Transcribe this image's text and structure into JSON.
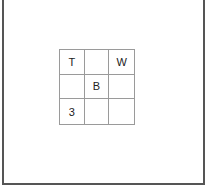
{
  "grid": {
    "rows": 3,
    "cols": 3,
    "cells": [
      [
        "T",
        "",
        "W"
      ],
      [
        "",
        "B",
        ""
      ],
      [
        "3",
        "",
        ""
      ]
    ]
  },
  "colors": {
    "frame": "#555555",
    "grid_line": "#9a9a9a",
    "text": "#222222",
    "background": "#ffffff"
  }
}
